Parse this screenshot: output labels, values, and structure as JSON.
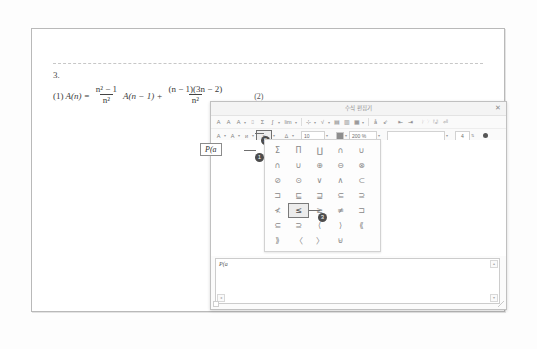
{
  "document": {
    "question_number": "3.",
    "equation": {
      "label": "(1)",
      "lhs": "A(n) =",
      "frac1_num": "n² − 1",
      "frac1_den": "n²",
      "mid": "A(n − 1) +",
      "frac2_num": "(n − 1)(3n − 2)",
      "frac2_den": "n²",
      "tag": "(2)"
    }
  },
  "dialog": {
    "title": "수식 편집기",
    "close_label": "✕",
    "toolbar_row1": [
      {
        "name": "font-style-a1",
        "glyph": "A"
      },
      {
        "name": "font-style-a2",
        "glyph": "A"
      },
      {
        "name": "font-style-a3",
        "glyph": "A"
      },
      {
        "name": "script-tool",
        "glyph": "⌷"
      },
      {
        "name": "sigma-tool",
        "glyph": "Σ"
      },
      {
        "name": "integral-tool",
        "glyph": "∫"
      },
      {
        "name": "limit-tool",
        "glyph": "lim"
      },
      {
        "name": "fraction-tool",
        "glyph": "⊹"
      },
      {
        "name": "root-tool",
        "glyph": "√"
      },
      {
        "name": "matrix-tool",
        "glyph": "▤"
      },
      {
        "name": "bracket-tool",
        "glyph": "▥"
      },
      {
        "name": "grid-tool",
        "glyph": "▦"
      },
      {
        "name": "accent-tool",
        "glyph": "å"
      },
      {
        "name": "arrow-tool",
        "glyph": "⇙"
      },
      {
        "name": "prev-tool",
        "glyph": "⇤"
      },
      {
        "name": "next-tool",
        "glyph": "⇥"
      },
      {
        "name": "open-tool",
        "glyph": "🗁"
      },
      {
        "name": "save-tool",
        "glyph": "🖫"
      },
      {
        "name": "insert-tool",
        "glyph": "⏎"
      }
    ],
    "toolbar_row2": [
      {
        "name": "greek-letters",
        "glyph": "Α"
      },
      {
        "name": "latin-letters",
        "glyph": "A"
      },
      {
        "name": "special-letters",
        "glyph": "ᴎ"
      },
      {
        "name": "relation-symbols",
        "glyph": "≤"
      },
      {
        "name": "delta-symbols",
        "glyph": "∆"
      }
    ],
    "font_size": "10",
    "zoom_level": "200 %",
    "style_field": "",
    "unit_field": "4"
  },
  "editor": {
    "current_expression": "P(a",
    "preview_expression": "P(a"
  },
  "callouts": [
    {
      "number": "1",
      "target": "expression-box"
    },
    {
      "number": "2",
      "target": "relation-symbol-toolbar-button"
    },
    {
      "number": "3",
      "target": "less-than-or-equal-symbol"
    }
  ],
  "palette": {
    "name": "relation-symbol-palette",
    "rows": [
      [
        "Σ",
        "Π",
        "∐",
        "∩",
        "∪"
      ],
      [
        "∩",
        "∪",
        "⊕",
        "⊖",
        "⊗"
      ],
      [
        "⊘",
        "⊙",
        "∨",
        "∧",
        "⊂"
      ],
      [
        "⊐",
        "⊑",
        "⊒",
        "⊆",
        "⊇"
      ],
      [
        "≮",
        "≤",
        "≥",
        "≢",
        "⊐"
      ],
      [
        "⊆",
        "⊇",
        "⟨",
        "⟩",
        "⟪"
      ],
      [
        "⟫",
        "〈",
        "〉",
        "⊌"
      ]
    ],
    "selected": "≤",
    "selected_row": 4,
    "selected_col": 1
  }
}
